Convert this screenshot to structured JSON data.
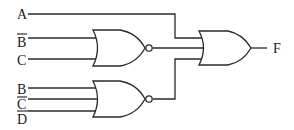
{
  "diagram": {
    "type": "logic-circuit",
    "inputs": [
      {
        "id": "A",
        "label": "A",
        "negated": false
      },
      {
        "id": "B_bar",
        "label": "B",
        "negated": true
      },
      {
        "id": "C",
        "label": "C",
        "negated": false
      },
      {
        "id": "B",
        "label": "B",
        "negated": false
      },
      {
        "id": "C_bar",
        "label": "C",
        "negated": true
      },
      {
        "id": "D_bar",
        "label": "D",
        "negated": true
      }
    ],
    "gates": [
      {
        "id": "nor1",
        "type": "NOR",
        "inputs": [
          "B_bar",
          "C"
        ]
      },
      {
        "id": "nor2",
        "type": "NOR",
        "inputs": [
          "B",
          "C_bar",
          "D_bar"
        ]
      },
      {
        "id": "or1",
        "type": "OR",
        "inputs": [
          "A",
          "nor1",
          "nor2"
        ]
      }
    ],
    "output": {
      "label": "F"
    },
    "colors": {
      "line": "#2a2a2a",
      "background": "#ffffff"
    }
  }
}
